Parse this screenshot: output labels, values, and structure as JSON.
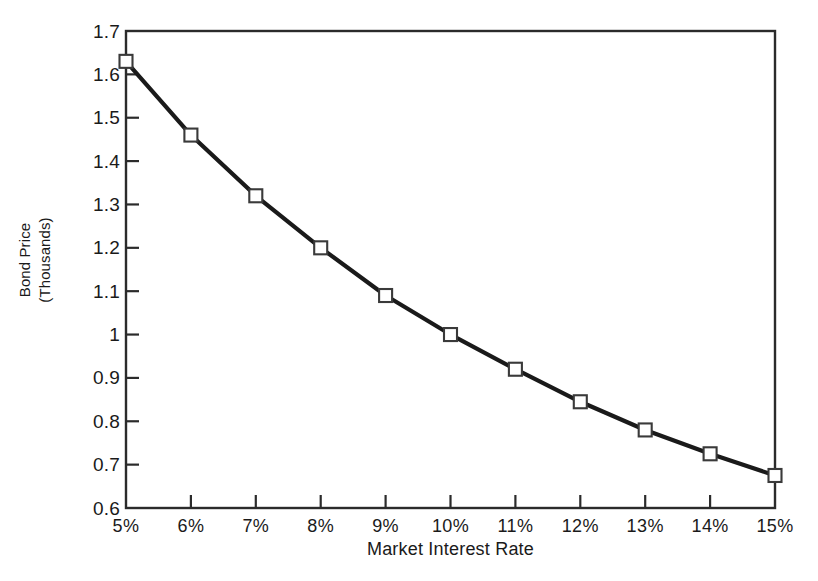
{
  "chart_data": {
    "type": "line",
    "title": "",
    "xlabel": "Market Interest Rate",
    "ylabel": "Bond Price (Thousands)",
    "ylabel_line1": "Bond Price",
    "ylabel_line2": "(Thousands)",
    "categories": [
      "5%",
      "6%",
      "7%",
      "8%",
      "9%",
      "10%",
      "11%",
      "12%",
      "13%",
      "14%",
      "15%"
    ],
    "x": [
      5,
      6,
      7,
      8,
      9,
      10,
      11,
      12,
      13,
      14,
      15
    ],
    "values": [
      1.63,
      1.46,
      1.32,
      1.2,
      1.09,
      1.0,
      0.92,
      0.845,
      0.78,
      0.725,
      0.675
    ],
    "ylim": [
      0.6,
      1.7
    ],
    "xlim": [
      5,
      15
    ],
    "ytick_labels": [
      "1.7",
      "1.6",
      "1.5",
      "1.4",
      "1.3",
      "1.2",
      "1.1",
      "1",
      "0.9",
      "0.8",
      "0.7",
      "0.6"
    ],
    "ytick_values": [
      1.7,
      1.6,
      1.5,
      1.4,
      1.3,
      1.2,
      1.1,
      1.0,
      0.9,
      0.8,
      0.7,
      0.6
    ],
    "xtick_labels": [
      "5%",
      "6%",
      "7%",
      "8%",
      "9%",
      "10%",
      "11%",
      "12%",
      "13%",
      "14%",
      "15%"
    ],
    "grid": false,
    "legend": "none",
    "marker": "open-square",
    "line_color": "#1a1a1a",
    "marker_face_color": "#ffffff",
    "marker_edge_color": "#3a3a3a",
    "axis_color": "#2b2b2b",
    "background_color": "#ffffff"
  }
}
